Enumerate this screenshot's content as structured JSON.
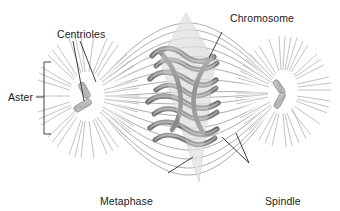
{
  "figure": {
    "background_color": "#ffffff"
  },
  "labels": {
    "centrioles": "Centrioles",
    "chromosome": "Chromosome",
    "aster": "Aster",
    "metaphase_plate_line1": "Metaphase",
    "metaphase_plate_line2": "plate",
    "spindle_fibers_line1": "Spindle",
    "spindle_fibers_line2": "fibers"
  },
  "colors": {
    "text": "#1a1a1a",
    "leader_line": "#2b2b2b",
    "spindle_fiber": "#8d8d8d",
    "aster_ray": "#b5b5b5",
    "chromosome_dark": "#6e6e6e",
    "chromosome_light": "#aaaaaa",
    "centriole_fill": "#b9b9b9",
    "centriole_stroke": "#7d7d7d",
    "plate_fill": "#d9d9d9",
    "plate_stroke": "#c2c2c2"
  },
  "parts": {
    "asters": [
      {
        "name": "left-aster",
        "cx": 88,
        "cy": 97,
        "ray_count": 40,
        "inner_radius": 17,
        "outer_radius": 52
      },
      {
        "name": "right-aster",
        "cx": 282,
        "cy": 93,
        "ray_count": 40,
        "inner_radius": 15,
        "outer_radius": 48
      }
    ],
    "centriole_pairs": [
      {
        "name": "left-centriole-pair",
        "cx": 88,
        "cy": 95
      },
      {
        "name": "right-centriole-pair",
        "cx": 282,
        "cy": 92
      }
    ],
    "metaphase_plate": {
      "apex_top_y": 13,
      "tip_bottom_y": 182,
      "center_x": 186
    },
    "spindle_fiber_count": 17,
    "chromosome_count": 10
  }
}
